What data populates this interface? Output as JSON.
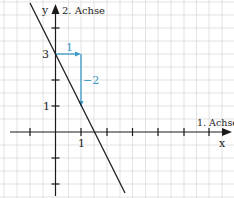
{
  "diagram": {
    "axes": {
      "x_axis_label": "1. Achse",
      "x_axis_var": "x",
      "y_axis_label": "2. Achse",
      "y_axis_var": "y"
    },
    "tick_labels": {
      "x_one": "1",
      "y_one": "1",
      "y_three": "3"
    },
    "slope_triangle": {
      "run_label": "1",
      "rise_label": "−2",
      "color": "#3a9bc4"
    },
    "line": {
      "y_intercept": 3,
      "slope": -2,
      "color": "#1a1a1a"
    },
    "grid_color": "#d9d9d9",
    "axis_color": "#1a1a1a"
  }
}
